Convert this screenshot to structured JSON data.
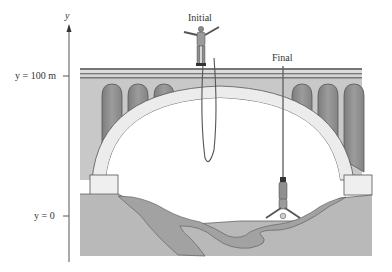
{
  "axis": {
    "name": "y",
    "top_label": "y = 100 m",
    "bottom_label": "y = 0"
  },
  "labels": {
    "initial": "Initial",
    "final": "Final"
  },
  "colors": {
    "bridge_face": "#c8c8c8",
    "arch": "#ececec",
    "arch_openings": "#8f8f8f",
    "ground": "#b9b9b9",
    "river": "#a2a2a2",
    "line": "#444444"
  },
  "scene": {
    "description": "Bungee jumper on a bridge: initial position standing on deck at y = 100 m, final position hanging upside down at bottom of stretched cord near y = 0"
  }
}
